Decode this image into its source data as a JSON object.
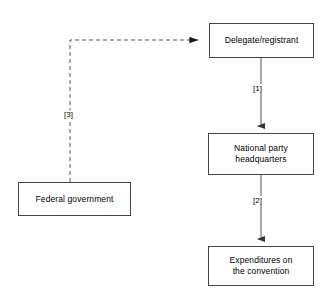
{
  "diagram": {
    "type": "flowchart",
    "background_color": "#ffffff",
    "box_border_color": "#444444",
    "line_color": "#555555",
    "text_color": "#000000",
    "nodes": [
      {
        "id": "delegate",
        "label": "Delegate/registrant",
        "x": 209,
        "y": 23,
        "width": 105,
        "height": 35
      },
      {
        "id": "national-party",
        "label": "National party\nheadquarters",
        "x": 208,
        "y": 133,
        "width": 106,
        "height": 42
      },
      {
        "id": "expenditures",
        "label": "Expenditures on\nthe convention",
        "x": 208,
        "y": 246,
        "width": 106,
        "height": 40
      },
      {
        "id": "federal-government",
        "label": "Federal government",
        "x": 18,
        "y": 182,
        "width": 113,
        "height": 34
      }
    ],
    "edges": [
      {
        "id": "edge-1",
        "from": "delegate",
        "to": "national-party",
        "label": "[1]",
        "style": "solid",
        "label_x": 252,
        "label_y": 84
      },
      {
        "id": "edge-2",
        "from": "national-party",
        "to": "expenditures",
        "label": "[2]",
        "style": "solid",
        "label_x": 252,
        "label_y": 196
      },
      {
        "id": "edge-3",
        "from": "federal-government",
        "to": "delegate",
        "label": "[3]",
        "style": "dashed",
        "label_x": 63,
        "label_y": 110
      }
    ]
  }
}
